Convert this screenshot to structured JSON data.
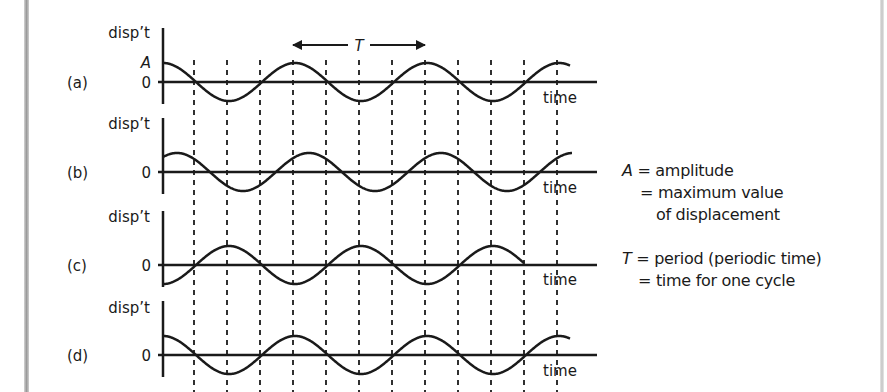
{
  "diagram": {
    "colors": {
      "ink": "#1a1a1a",
      "background": "#ffffff",
      "page_edge": "#a8a8a8"
    },
    "period_marker": {
      "symbol": "T",
      "x_start": 293,
      "x_end": 425,
      "y": 45
    },
    "dashed_lines_x": [
      194,
      227,
      260,
      293,
      326,
      359,
      392,
      425,
      458,
      491,
      524,
      557
    ],
    "panels": [
      {
        "id": "a",
        "label": "(a)",
        "y_axis_label": "disp’t",
        "amplitude_label": "A",
        "zero_label": "0",
        "x_axis_label": "time",
        "baseline_y": 82,
        "phase_deg": 0,
        "end_x": 570
      },
      {
        "id": "b",
        "label": "(b)",
        "y_axis_label": "disp’t",
        "zero_label": "0",
        "x_axis_label": "time",
        "baseline_y": 172,
        "phase_deg": -38,
        "end_x": 572
      },
      {
        "id": "c",
        "label": "(c)",
        "y_axis_label": "disp’t",
        "zero_label": "0",
        "x_axis_label": "time",
        "baseline_y": 265,
        "phase_deg": 180,
        "end_x": 524
      },
      {
        "id": "d",
        "label": "(d)",
        "y_axis_label": "disp’t",
        "zero_label": "0",
        "x_axis_label": "time",
        "baseline_y": 355,
        "phase_deg": 0,
        "end_x": 570
      }
    ]
  },
  "legend": {
    "amplitude": {
      "symbol": "A",
      "line1": " = amplitude",
      "line2": "= maximum value",
      "line3": "of displacement"
    },
    "period": {
      "symbol": "T",
      "line1": " = period (periodic time)",
      "line2": "= time for one cycle"
    }
  },
  "chart_data": {
    "type": "line",
    "title": "",
    "xlabel": "time",
    "ylabel": "disp’t",
    "grid": "dashed vertical lines every quarter period",
    "period_label": "T",
    "series": [
      {
        "name": "(a)",
        "function": "A cos(2πt/T)",
        "phase_deg": 0,
        "cycles_shown": 3.1
      },
      {
        "name": "(b)",
        "function": "A cos(2πt/T - 38°)",
        "phase_deg": -38,
        "cycles_shown": 3.1
      },
      {
        "name": "(c)",
        "function": "-A cos(2πt/T)",
        "phase_deg": 180,
        "cycles_shown": 2.75
      },
      {
        "name": "(d)",
        "function": "A cos(2πt/T)",
        "phase_deg": 0,
        "cycles_shown": 3.1
      }
    ],
    "annotations": [
      "A = amplitude = maximum value of displacement",
      "T = period (periodic time) = time for one cycle"
    ]
  }
}
